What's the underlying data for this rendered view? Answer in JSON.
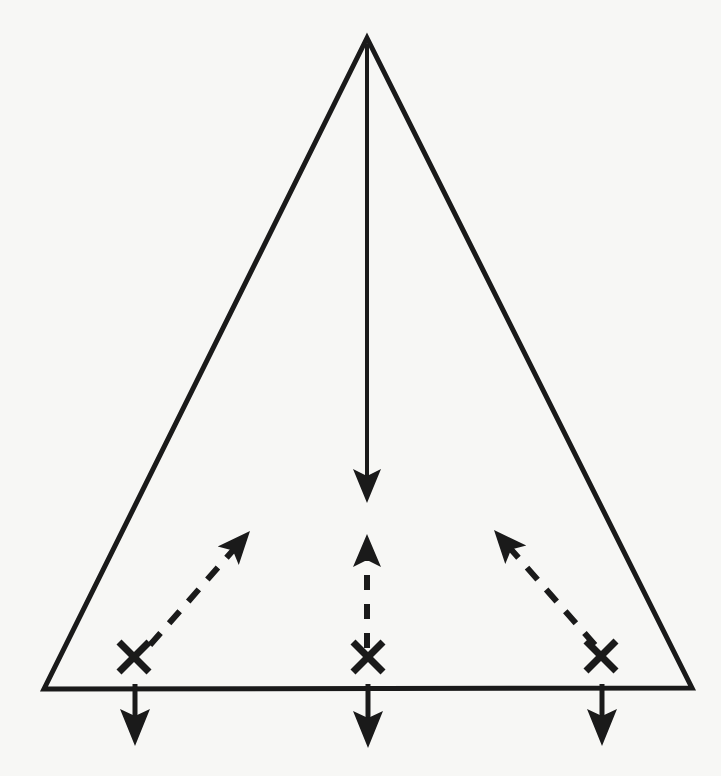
{
  "document": {
    "kind": "line-diagram",
    "title": "",
    "background_color": "#f7f7f5",
    "ink_color": "#1a1a1a",
    "width": 721,
    "height": 776
  },
  "diagram": {
    "name": "triangle-with-flow-arrows",
    "stroke_color": "#1a1a1a",
    "stroke_width": 4,
    "triangle": {
      "label": "",
      "apex": {
        "x": 367,
        "y": 38
      },
      "bottom_left": {
        "x": 44,
        "y": 689
      },
      "bottom_right": {
        "x": 692,
        "y": 688
      },
      "points": "367,38 44,689 692,688"
    },
    "center_down_arrow": {
      "label": "",
      "from": {
        "x": 367,
        "y": 44
      },
      "to": {
        "x": 367,
        "y": 503
      },
      "style": "solid",
      "head": "filled-triangle"
    },
    "x_markers": [
      {
        "label": "",
        "x": 134,
        "y": 657,
        "size": 30
      },
      {
        "label": "",
        "x": 368,
        "y": 657,
        "size": 30
      },
      {
        "label": "",
        "x": 601,
        "y": 656,
        "size": 30
      }
    ],
    "dashed_up_arrows": [
      {
        "label": "",
        "from": {
          "x": 150,
          "y": 645
        },
        "to": {
          "x": 250,
          "y": 531
        },
        "style": "dashed",
        "head": "filled-triangle"
      },
      {
        "label": "",
        "from": {
          "x": 367,
          "y": 648
        },
        "to": {
          "x": 367,
          "y": 534
        },
        "style": "dashed",
        "head": "filled-triangle"
      },
      {
        "label": "",
        "from": {
          "x": 595,
          "y": 645
        },
        "to": {
          "x": 494,
          "y": 530
        },
        "style": "dashed",
        "head": "filled-triangle"
      }
    ],
    "baseline_down_arrows": [
      {
        "label": "",
        "from": {
          "x": 135,
          "y": 684
        },
        "to": {
          "x": 135,
          "y": 746
        },
        "style": "solid",
        "head": "filled-triangle"
      },
      {
        "label": "",
        "from": {
          "x": 368,
          "y": 684
        },
        "to": {
          "x": 368,
          "y": 748
        },
        "style": "solid",
        "head": "filled-triangle"
      },
      {
        "label": "",
        "from": {
          "x": 602,
          "y": 684
        },
        "to": {
          "x": 602,
          "y": 746
        },
        "style": "solid",
        "head": "filled-triangle"
      }
    ]
  }
}
